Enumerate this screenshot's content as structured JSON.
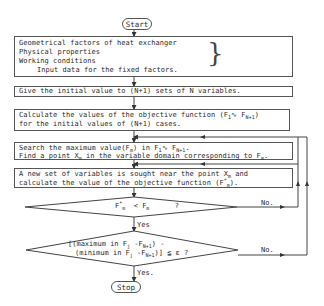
{
  "flowchart": {
    "start": {
      "label": "Start"
    },
    "stop": {
      "label": "Stop"
    },
    "input_box": {
      "lines": [
        "Geometrical factors of heat exchanger",
        "Physical properties",
        "Working conditions"
      ],
      "caption": "Input data for the fixed factors."
    },
    "init_box": {
      "text": "Give the initial value to (N+1) sets of N variables."
    },
    "calc_box": {
      "line1_prefix": "Calculate the values of the objective function (F",
      "line1_sub1": "1",
      "line1_mid": "∿ F",
      "line1_sub2": "N+1",
      "line1_suffix": ")",
      "line2": "for the initial values of (N+1) cases."
    },
    "search_box": {
      "line1_prefix": "Search the maximum value(F",
      "line1_sub1": "m",
      "line1_mid1": ") in F",
      "line1_sub2": "1",
      "line1_mid2": "∿ F",
      "line1_sub3": "N+1",
      "line1_suffix": ".",
      "line2_prefix": "Find a point X",
      "line2_sub1": "m",
      "line2_mid": " in the variable domain corresponding to F",
      "line2_sub2": "m",
      "line2_suffix": "."
    },
    "newset_box": {
      "line1_prefix": "A new set of variables is sought near the point X",
      "line1_sub": "m",
      "line1_suffix": " and",
      "line2_prefix": "calculate the value of the objective function (F",
      "line2_sup": "*",
      "line2_sub": "m",
      "line2_suffix": ")."
    },
    "decision1": {
      "lhs": "F",
      "lhs_sup": "*",
      "lhs_sub": "m",
      "op": "<",
      "rhs": "F",
      "rhs_sub": "m",
      "q": "?",
      "yes_label": "Yes",
      "no_label": "No."
    },
    "decision2": {
      "line1_prefix": "[(maximum in F",
      "line1_sub1": "j",
      "line1_mid": " -F",
      "line1_sub2": "N+1",
      "line1_suffix": ") -",
      "line2_prefix": "(minimum in F",
      "line2_sub1": "j",
      "line2_mid": " -F",
      "line2_sub2": "N+1",
      "line2_suffix": ")] ≦ ε  ?",
      "yes_label": "Yes.",
      "no_label": "No."
    }
  }
}
